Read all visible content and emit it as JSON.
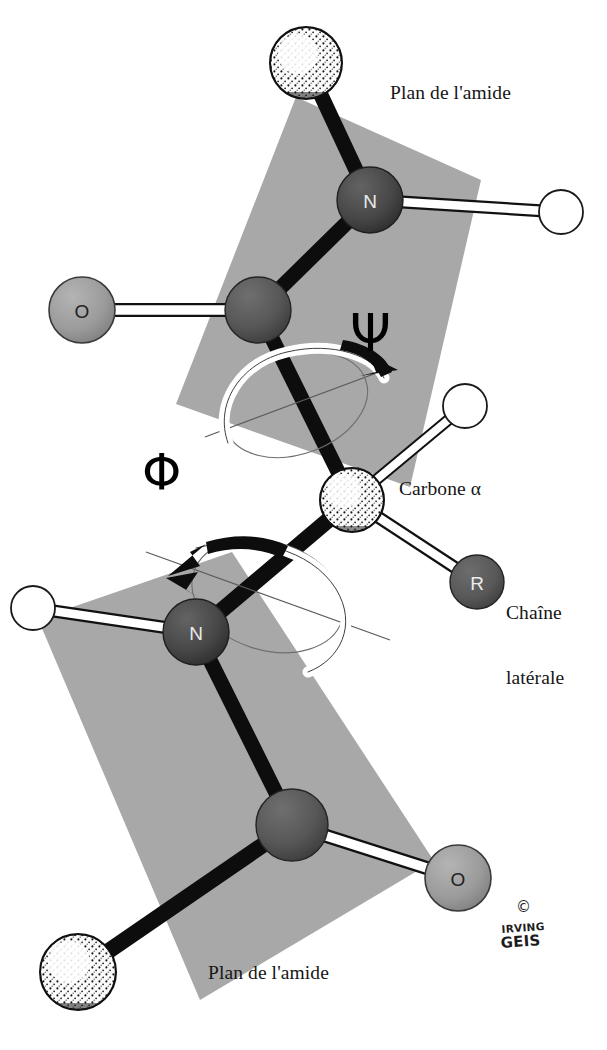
{
  "figure": {
    "title": "Plan de l'amide",
    "language": "fr"
  },
  "labels": {
    "plane_top": "Plan de l'amide",
    "plane_bottom": "Plan de l'amide",
    "alpha_carbon": "Carbone α",
    "side_chain_line1": "Chaîne",
    "side_chain_line2": "latérale",
    "psi": "Ψ",
    "phi": "Φ"
  },
  "signature": {
    "copyright": "©",
    "name_line1": "IRVING",
    "name_line2": "GEIS"
  },
  "atoms": {
    "ca_top": {
      "label": "",
      "kind": "alpha-carbon",
      "cx": 306,
      "cy": 63,
      "r": 36
    },
    "n_top": {
      "label": "N",
      "kind": "nitrogen",
      "cx": 370,
      "cy": 200,
      "r": 33
    },
    "h_top": {
      "label": "",
      "kind": "hydrogen",
      "cx": 561,
      "cy": 212,
      "r": 22
    },
    "c_top": {
      "label": "",
      "kind": "carbonyl-carbon",
      "cx": 258,
      "cy": 310,
      "r": 33
    },
    "o_top": {
      "label": "O",
      "kind": "oxygen",
      "cx": 82,
      "cy": 310,
      "r": 33
    },
    "ca_center": {
      "label": "",
      "kind": "alpha-carbon",
      "cx": 352,
      "cy": 500,
      "r": 32
    },
    "h_center": {
      "label": "",
      "kind": "hydrogen",
      "cx": 465,
      "cy": 406,
      "r": 22
    },
    "r_group": {
      "label": "R",
      "kind": "side-chain",
      "cx": 477,
      "cy": 582,
      "r": 27
    },
    "n_bottom": {
      "label": "N",
      "kind": "nitrogen",
      "cx": 196,
      "cy": 632,
      "r": 33
    },
    "h_bottom": {
      "label": "",
      "kind": "hydrogen",
      "cx": 33,
      "cy": 608,
      "r": 22
    },
    "c_bottom": {
      "label": "",
      "kind": "carbonyl-carbon",
      "cx": 292,
      "cy": 825,
      "r": 36
    },
    "o_bottom": {
      "label": "O",
      "kind": "oxygen",
      "cx": 458,
      "cy": 878,
      "r": 33
    },
    "ca_bottom": {
      "label": "",
      "kind": "alpha-carbon",
      "cx": 78,
      "cy": 972,
      "r": 38
    }
  },
  "colors": {
    "plane_gray": "#a8a8a8",
    "nitrogen": "#474747",
    "carbonyl_carbon": "#575757",
    "oxygen": "#9b9b9b",
    "side_chain": "#585858",
    "hydrogen": "#ffffff",
    "alpha_carbon": "#f2f2f2",
    "bond_dark": "#0d0d0d",
    "bond_light": "#ffffff",
    "background": "#ffffff",
    "text": "#161616"
  },
  "planes": {
    "top_points": "176,404 296,97 481,180 410,487",
    "bottom_points": "38,619 232,552 434,861 200,1000"
  },
  "torsions": [
    {
      "name": "psi",
      "symbol": "Ψ",
      "axis": "Calpha-C",
      "direction": "clockwise"
    },
    {
      "name": "phi",
      "symbol": "Φ",
      "axis": "N-Calpha",
      "direction": "counterclockwise"
    }
  ]
}
